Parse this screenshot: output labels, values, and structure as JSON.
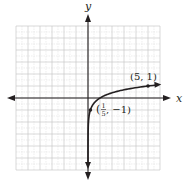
{
  "chart_data": {
    "type": "line",
    "title": "",
    "function": "y = log_5(x)",
    "xlabel": "x",
    "ylabel": "y",
    "xlim": [
      -6,
      6
    ],
    "ylim": [
      -6,
      6
    ],
    "grid": true,
    "grid_major_step": 1,
    "grid_minor_step": 0.5,
    "legend": null,
    "series": [
      {
        "name": "log5(x)",
        "x": [
          0.0016,
          0.008,
          0.04,
          0.2,
          0.5,
          1,
          2,
          3,
          4,
          5,
          6
        ],
        "y": [
          -4,
          -3,
          -2,
          -1,
          -0.43,
          0,
          0.43,
          0.68,
          0.86,
          1,
          1.11
        ]
      }
    ],
    "points": [
      {
        "x": 5,
        "y": 1,
        "label": "(5, 1)"
      },
      {
        "x": 0.2,
        "y": -1,
        "label_prefix": "(",
        "label_num": "1",
        "label_den": "5",
        "label_suffix": ", −1)"
      }
    ],
    "colors": {
      "curve": "#231f20",
      "axis": "#231f20",
      "grid_major": "#c8c8c8",
      "grid_minor": "#e2e2e2"
    }
  }
}
